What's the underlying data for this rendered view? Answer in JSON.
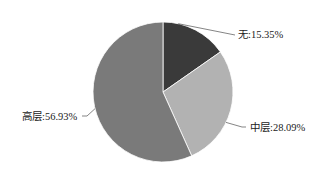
{
  "chart_data": {
    "type": "pie",
    "title": "",
    "labels": [
      "无",
      "中层",
      "高层"
    ],
    "values": [
      15.35,
      28.09,
      56.93
    ],
    "unit": "%",
    "colors": [
      "#3a3a3a",
      "#b2b2b2",
      "#7a7a7a"
    ],
    "start_angle_deg": 0,
    "direction": "clockwise",
    "legend": "none",
    "data_labels": [
      "无:15.35%",
      "中层:28.09%",
      "高层:56.93%"
    ]
  }
}
